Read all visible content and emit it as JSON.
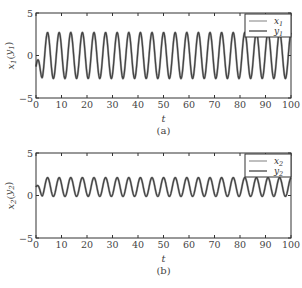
{
  "chart_data": [
    {
      "type": "line",
      "panel": "(a)",
      "caption": "(a)",
      "xlabel": "t",
      "ylabel": "x1(y1)",
      "xlim": [
        0,
        100
      ],
      "ylim": [
        -5,
        5
      ],
      "xticks": [
        0,
        10,
        20,
        30,
        40,
        50,
        60,
        70,
        80,
        90,
        100
      ],
      "yticks": [
        -5,
        0,
        5
      ],
      "grid": false,
      "legend_position": "upper right",
      "series": [
        {
          "name": "x1",
          "color": "#b0b0b0",
          "amplitude": 2.7,
          "offset": 0.0,
          "period": 4.55,
          "initial": -1.3
        },
        {
          "name": "y1",
          "color": "#444444",
          "amplitude": 2.7,
          "offset": 0.0,
          "period": 4.55,
          "initial": -1.3
        }
      ]
    },
    {
      "type": "line",
      "panel": "(b)",
      "caption": "(b)",
      "xlabel": "t",
      "ylabel": "x2(y2)",
      "xlim": [
        0,
        100
      ],
      "ylim": [
        -5,
        5
      ],
      "xticks": [
        0,
        10,
        20,
        30,
        40,
        50,
        60,
        70,
        80,
        90,
        100
      ],
      "yticks": [
        -5,
        0,
        5
      ],
      "grid": false,
      "legend_position": "upper right",
      "series": [
        {
          "name": "x2",
          "color": "#b0b0b0",
          "amplitude": 1.1,
          "offset": 1.0,
          "period": 4.55,
          "initial": 0.0
        },
        {
          "name": "y2",
          "color": "#444444",
          "amplitude": 1.1,
          "offset": 1.0,
          "period": 4.55,
          "initial": 0.0
        }
      ]
    }
  ],
  "panels": {
    "a": {
      "ylabel_main": "x",
      "ylabel_sub": "1",
      "ylabel_paren": "y",
      "ylabel_paren_sub": "1",
      "xlabel": "t",
      "caption": "(a)",
      "legend": [
        {
          "main": "x",
          "sub": "1"
        },
        {
          "main": "y",
          "sub": "1"
        }
      ]
    },
    "b": {
      "ylabel_main": "x",
      "ylabel_sub": "2",
      "ylabel_paren": "y",
      "ylabel_paren_sub": "2",
      "xlabel": "t",
      "caption": "(b)",
      "legend": [
        {
          "main": "x",
          "sub": "2"
        },
        {
          "main": "y",
          "sub": "2"
        }
      ]
    }
  }
}
